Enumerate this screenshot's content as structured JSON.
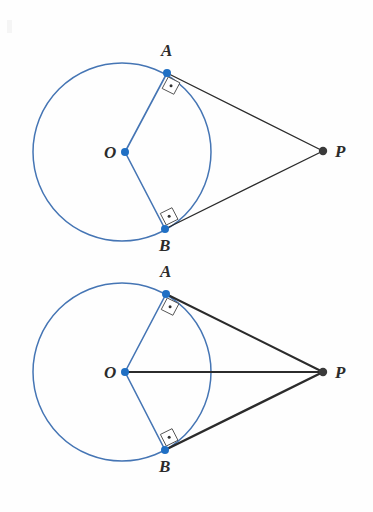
{
  "figure": {
    "background_color": "#fefefe",
    "colors": {
      "circle_stroke": "#4575b4",
      "radius_stroke": "#4575b4",
      "point_fill_blue": "#1f6fc4",
      "point_fill_dark": "#3a3a3a",
      "tangent_stroke": "#2b2b2b",
      "label_color": "#2b2b2b",
      "angle_marker_fill": "#ffffff",
      "angle_marker_stroke": "#555555"
    },
    "diagrams": [
      {
        "id": "diagram-top",
        "name": "circle-with-two-tangents",
        "circle": {
          "cx": 122,
          "cy": 152,
          "r": 89
        },
        "points": [
          {
            "id": "O",
            "label": "O",
            "x": 125,
            "y": 152,
            "style": "blue",
            "label_x": 104,
            "label_y": 158
          },
          {
            "id": "A",
            "label": "A",
            "x": 167,
            "y": 73,
            "style": "blue",
            "label_x": 161,
            "label_y": 56
          },
          {
            "id": "B",
            "label": "B",
            "x": 165,
            "y": 229,
            "style": "blue",
            "label_x": 159,
            "label_y": 251
          },
          {
            "id": "P",
            "label": "P",
            "x": 323,
            "y": 151,
            "style": "dark",
            "label_x": 335,
            "label_y": 157
          }
        ],
        "segments": [
          {
            "from": "O",
            "to": "A",
            "color": "blue",
            "width": 1.6,
            "name": "radius-OA"
          },
          {
            "from": "O",
            "to": "B",
            "color": "blue",
            "width": 1.6,
            "name": "radius-OB"
          },
          {
            "from": "A",
            "to": "P",
            "color": "black",
            "width": 1.3,
            "name": "tangent-AP"
          },
          {
            "from": "B",
            "to": "P",
            "color": "black",
            "width": 1.3,
            "name": "tangent-BP"
          }
        ],
        "right_angles": [
          {
            "at": "A",
            "name": "right-angle-marker-A"
          },
          {
            "at": "B",
            "name": "right-angle-marker-B"
          }
        ]
      },
      {
        "id": "diagram-bottom",
        "name": "circle-with-two-tangents-and-OP",
        "circle": {
          "cx": 122,
          "cy": 372,
          "r": 89
        },
        "points": [
          {
            "id": "O",
            "label": "O",
            "x": 125,
            "y": 372,
            "style": "blue",
            "label_x": 104,
            "label_y": 378
          },
          {
            "id": "A",
            "label": "A",
            "x": 166,
            "y": 294,
            "style": "blue",
            "label_x": 160,
            "label_y": 277
          },
          {
            "id": "B",
            "label": "B",
            "x": 165,
            "y": 450,
            "style": "blue",
            "label_x": 159,
            "label_y": 472
          },
          {
            "id": "P",
            "label": "P",
            "x": 323,
            "y": 372,
            "style": "dark",
            "label_x": 335,
            "label_y": 378
          }
        ],
        "segments": [
          {
            "from": "O",
            "to": "A",
            "color": "blue",
            "width": 1.6,
            "name": "radius-OA"
          },
          {
            "from": "O",
            "to": "B",
            "color": "blue",
            "width": 1.6,
            "name": "radius-OB"
          },
          {
            "from": "A",
            "to": "P",
            "color": "black",
            "width": 2.0,
            "name": "tangent-AP"
          },
          {
            "from": "B",
            "to": "P",
            "color": "black",
            "width": 2.4,
            "name": "tangent-BP"
          },
          {
            "from": "O",
            "to": "P",
            "color": "black",
            "width": 1.8,
            "name": "segment-OP"
          }
        ],
        "right_angles": [
          {
            "at": "A",
            "name": "right-angle-marker-A"
          },
          {
            "at": "B",
            "name": "right-angle-marker-B"
          }
        ]
      }
    ]
  }
}
